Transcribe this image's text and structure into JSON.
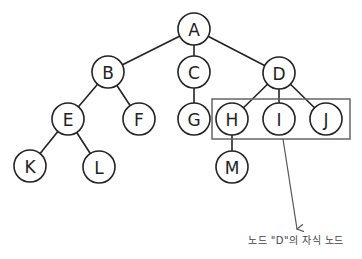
{
  "diagram": {
    "type": "tree",
    "nodes": [
      {
        "id": "A",
        "label": "A",
        "x": 194,
        "y": 29
      },
      {
        "id": "B",
        "label": "B",
        "x": 108,
        "y": 72
      },
      {
        "id": "C",
        "label": "C",
        "x": 194,
        "y": 72
      },
      {
        "id": "D",
        "label": "D",
        "x": 279,
        "y": 73
      },
      {
        "id": "E",
        "label": "E",
        "x": 68,
        "y": 119
      },
      {
        "id": "F",
        "label": "F",
        "x": 139,
        "y": 119
      },
      {
        "id": "G",
        "label": "G",
        "x": 194,
        "y": 119
      },
      {
        "id": "H",
        "label": "H",
        "x": 232,
        "y": 119
      },
      {
        "id": "I",
        "label": "I",
        "x": 279,
        "y": 119
      },
      {
        "id": "J",
        "label": "J",
        "x": 326,
        "y": 119
      },
      {
        "id": "K",
        "label": "K",
        "x": 30,
        "y": 166
      },
      {
        "id": "L",
        "label": "L",
        "x": 99,
        "y": 167
      },
      {
        "id": "M",
        "label": "M",
        "x": 232,
        "y": 167
      }
    ],
    "edges": [
      [
        "A",
        "B"
      ],
      [
        "A",
        "C"
      ],
      [
        "A",
        "D"
      ],
      [
        "B",
        "E"
      ],
      [
        "B",
        "F"
      ],
      [
        "C",
        "G"
      ],
      [
        "D",
        "H"
      ],
      [
        "D",
        "I"
      ],
      [
        "D",
        "J"
      ],
      [
        "E",
        "K"
      ],
      [
        "E",
        "L"
      ],
      [
        "H",
        "M"
      ]
    ],
    "highlight_group": {
      "members": [
        "H",
        "I",
        "J"
      ],
      "x": 212,
      "y": 99,
      "width": 138,
      "height": 40
    },
    "annotation": {
      "text": "노드 \"D\"의 자식 노드",
      "arrow_from": [
        283,
        139
      ],
      "arrow_to": [
        297,
        229
      ]
    }
  }
}
